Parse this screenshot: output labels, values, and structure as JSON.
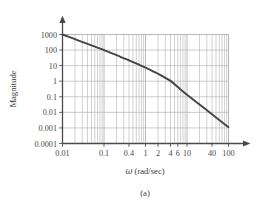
{
  "figure": {
    "caption": "(a)"
  },
  "chart_data": {
    "type": "line",
    "title": "",
    "xlabel": "ω (rad/sec)",
    "ylabel": "Magnitude",
    "xscale": "log",
    "yscale": "log",
    "xlim": [
      0.01,
      100
    ],
    "ylim": [
      0.0001,
      1000
    ],
    "grid": true,
    "legend": false,
    "xticks": [
      0.01,
      0.1,
      0.4,
      1,
      2,
      4,
      6,
      10,
      40,
      100
    ],
    "xticklabels": [
      "0.01",
      "0.1",
      "0.4",
      "1",
      "2",
      "4",
      "6",
      "10",
      "40",
      "100"
    ],
    "yticks": [
      0.0001,
      0.001,
      0.01,
      0.1,
      1,
      10,
      100,
      1000
    ],
    "yticklabels": [
      "0.0001",
      "0.001",
      "0.01",
      "0.1",
      "1",
      "10",
      "100",
      "1000"
    ],
    "series": [
      {
        "name": "magnitude",
        "x": [
          0.01,
          0.02,
          0.04,
          0.07,
          0.1,
          0.2,
          0.4,
          0.7,
          1,
          2,
          4,
          6,
          10,
          20,
          40,
          70,
          100
        ],
        "y": [
          1000,
          500,
          250,
          145,
          100,
          48,
          22,
          11.5,
          7.5,
          3.0,
          1.05,
          0.42,
          0.135,
          0.032,
          0.0075,
          0.0023,
          0.0011
        ]
      }
    ],
    "colors": {
      "curve": "#454545",
      "grid": "#b4b4b4",
      "axis": "#4a4a4a",
      "text": "#3c3c3c",
      "background": "#ffffff"
    }
  },
  "axes": {
    "y_label": "Magnitude",
    "x_label_omega": "ω",
    "x_label_units": "(rad/sec)"
  }
}
